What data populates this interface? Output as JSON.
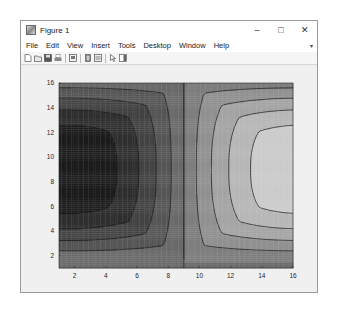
{
  "window": {
    "title": "Figure 1",
    "controls": {
      "minimize": "–",
      "maximize": "□",
      "close": "✕"
    }
  },
  "menubar": {
    "items": [
      "File",
      "Edit",
      "View",
      "Insert",
      "Tools",
      "Desktop",
      "Window",
      "Help"
    ],
    "overflow_arrow": "▾"
  },
  "toolbar": {
    "icons": [
      "new-figure-icon",
      "open-file-icon",
      "save-icon",
      "print-icon",
      "separator",
      "link-plot-icon",
      "separator",
      "insert-colorbar-icon",
      "insert-legend-icon",
      "separator",
      "edit-plot-pointer-icon",
      "show-plot-tools-icon"
    ]
  },
  "chart_data": {
    "type": "contourf",
    "title": "",
    "xlabel": "",
    "ylabel": "",
    "xlim": [
      1,
      16
    ],
    "ylim": [
      1,
      16
    ],
    "xticks": [
      2,
      4,
      6,
      8,
      10,
      12,
      14,
      16
    ],
    "yticks": [
      2,
      4,
      6,
      8,
      10,
      12,
      14,
      16
    ],
    "colormap": "gray",
    "levels": 10,
    "grid": false,
    "legend": null,
    "extrema": {
      "min": {
        "x": 1,
        "y": 9,
        "shade": "#1c1c1c"
      },
      "max": {
        "x": 16,
        "y": 9,
        "shade": "#d9d9d9"
      }
    },
    "zero_contour_x": 9.0
  },
  "colors": {
    "window_bg": "#f0f0f0",
    "titlebar_bg": "#ffffff",
    "axes_border": "#262626",
    "contour_line": "#1a1a1a",
    "tick_label": "#262626"
  }
}
